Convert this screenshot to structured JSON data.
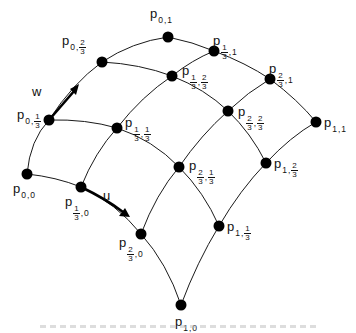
{
  "diagram": {
    "parameters": {
      "u_label": "u",
      "w_label": "w"
    },
    "nodes": [
      {
        "id": "p00",
        "label": "p",
        "i": "0",
        "j": "0",
        "x": 27,
        "y": 174
      },
      {
        "id": "p0_13",
        "label": "p",
        "i": "0",
        "j": "1/3",
        "x": 49,
        "y": 120
      },
      {
        "id": "p0_23",
        "label": "p",
        "i": "0",
        "j": "2/3",
        "x": 102,
        "y": 62
      },
      {
        "id": "p01",
        "label": "p",
        "i": "0",
        "j": "1",
        "x": 168,
        "y": 37
      },
      {
        "id": "p13_0",
        "label": "p",
        "i": "1/3",
        "j": "0",
        "x": 81,
        "y": 187
      },
      {
        "id": "p13_13",
        "label": "p",
        "i": "1/3",
        "j": "1/3",
        "x": 117,
        "y": 128
      },
      {
        "id": "p13_23",
        "label": "p",
        "i": "1/3",
        "j": "2/3",
        "x": 172,
        "y": 76
      },
      {
        "id": "p13_1",
        "label": "p",
        "i": "1/3",
        "j": "1",
        "x": 214,
        "y": 51
      },
      {
        "id": "p23_0",
        "label": "p",
        "i": "2/3",
        "j": "0",
        "x": 141,
        "y": 234
      },
      {
        "id": "p23_13",
        "label": "p",
        "i": "2/3",
        "j": "1/3",
        "x": 179,
        "y": 167
      },
      {
        "id": "p23_23",
        "label": "p",
        "i": "2/3",
        "j": "2/3",
        "x": 228,
        "y": 111
      },
      {
        "id": "p23_1",
        "label": "p",
        "i": "2/3",
        "j": "1",
        "x": 270,
        "y": 79
      },
      {
        "id": "p10",
        "label": "p",
        "i": "1",
        "j": "0",
        "x": 181,
        "y": 305
      },
      {
        "id": "p1_13",
        "label": "p",
        "i": "1",
        "j": "1/3",
        "x": 219,
        "y": 226
      },
      {
        "id": "p1_23",
        "label": "p",
        "i": "1",
        "j": "2/3",
        "x": 266,
        "y": 163
      },
      {
        "id": "p11",
        "label": "p",
        "i": "1",
        "j": "1",
        "x": 316,
        "y": 122
      }
    ],
    "labels": {
      "p00": {
        "base": "p",
        "a": "0",
        "b": "0"
      },
      "p0_13": {
        "base": "p",
        "a": "0",
        "b_num": "1",
        "b_den": "3"
      },
      "p0_23": {
        "base": "p",
        "a": "0",
        "b_num": "2",
        "b_den": "3"
      },
      "p01": {
        "base": "p",
        "a": "0",
        "b": "1"
      },
      "p13_0": {
        "base": "p",
        "a_num": "1",
        "a_den": "3",
        "b": "0"
      },
      "p13_13": {
        "base": "p",
        "a_num": "1",
        "a_den": "3",
        "b_num": "1",
        "b_den": "3"
      },
      "p13_23": {
        "base": "p",
        "a_num": "1",
        "a_den": "3",
        "b_num": "2",
        "b_den": "3"
      },
      "p13_1": {
        "base": "p",
        "a_num": "1",
        "a_den": "3",
        "b": "1"
      },
      "p23_0": {
        "base": "p",
        "a_num": "2",
        "a_den": "3",
        "b": "0"
      },
      "p23_13": {
        "base": "p",
        "a_num": "2",
        "a_den": "3",
        "b_num": "1",
        "b_den": "3"
      },
      "p23_23": {
        "base": "p",
        "a_num": "2",
        "a_den": "3",
        "b_num": "2",
        "b_den": "3"
      },
      "p23_1": {
        "base": "p",
        "a_num": "2",
        "a_den": "3",
        "b": "1"
      },
      "p10": {
        "base": "p",
        "a": "1",
        "b": "0"
      },
      "p1_13": {
        "base": "p",
        "a": "1",
        "b_num": "1",
        "b_den": "3"
      },
      "p1_23": {
        "base": "p",
        "a": "1",
        "b_num": "2",
        "b_den": "3"
      },
      "p11": {
        "base": "p",
        "a": "1",
        "b": "1"
      }
    },
    "comma": ","
  }
}
